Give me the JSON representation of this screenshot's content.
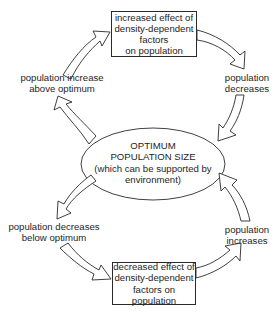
{
  "diagram": {
    "type": "cycle",
    "center": {
      "shape": "ellipse",
      "lines": [
        "OPTIMUM",
        "POPULATION SIZE",
        "(which can be supported by",
        "environment)"
      ]
    },
    "top_box": {
      "lines": [
        "increased effect of",
        "density-dependent",
        "factors",
        "on population"
      ]
    },
    "bottom_box": {
      "lines": [
        "decreased effect of",
        "density-dependent",
        "factors on",
        "population"
      ]
    },
    "labels": {
      "upper_left": [
        "population increase",
        "above optimum"
      ],
      "upper_right": [
        "population",
        "decreases"
      ],
      "lower_left": [
        "population decreases",
        "below optimum"
      ],
      "lower_right": [
        "population",
        "increases"
      ]
    },
    "arrows": [
      {
        "from": "center",
        "to": "upper_left",
        "style": "hollow-curved"
      },
      {
        "from": "upper_left",
        "to": "top_box",
        "style": "hollow-curved"
      },
      {
        "from": "top_box",
        "to": "upper_right",
        "style": "hollow-curved"
      },
      {
        "from": "upper_right",
        "to": "center",
        "style": "hollow-curved"
      },
      {
        "from": "center",
        "to": "lower_left",
        "style": "hollow-curved"
      },
      {
        "from": "lower_left",
        "to": "bottom_box",
        "style": "hollow-curved"
      },
      {
        "from": "bottom_box",
        "to": "lower_right",
        "style": "hollow-curved"
      },
      {
        "from": "lower_right",
        "to": "center",
        "style": "hollow-curved"
      }
    ],
    "colors": {
      "stroke": "#2a2a2a",
      "fill": "#ffffff",
      "text": "#1e1e1e"
    }
  }
}
